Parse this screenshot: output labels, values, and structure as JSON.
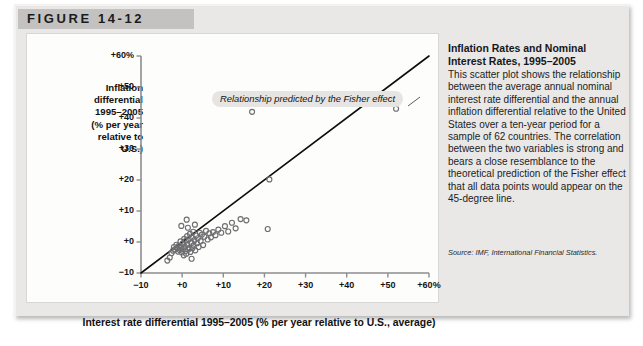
{
  "figure": {
    "label": "FIGURE 14-12"
  },
  "caption": {
    "title": "Inflation Rates and Nominal Interest Rates, 1995–2005",
    "body": "This scatter plot shows the relationship between the average annual nominal interest rate differential and the annual inflation differential relative to the United States over a ten-year period for a sample of 62 countries. The correlation between the two variables is strong and bears a close resemblance to the theoretical prediction of the Fisher effect that all data points would appear on the 45-degree line.",
    "source": "Source: IMF, International Financial Statistics."
  },
  "chart_data": {
    "type": "scatter",
    "title": "Inflation Rates and Nominal Interest Rates, 1995–2005",
    "xlabel": "Interest rate differential 1995–2005 (% per year relative to U.S., average)",
    "ylabel": "Inflation differential 1995–2005 (% per year relative to U.S.)",
    "xlim": [
      -10,
      60
    ],
    "ylim": [
      -10,
      60
    ],
    "xticks": [
      -10,
      0,
      10,
      20,
      30,
      40,
      50,
      60
    ],
    "yticks": [
      -10,
      0,
      10,
      20,
      30,
      40,
      50,
      60
    ],
    "xticklabels": [
      "−10",
      "+0",
      "+10",
      "+20",
      "+30",
      "+40",
      "+50",
      "+60%"
    ],
    "yticklabels": [
      "−10",
      "+0",
      "+10",
      "+20",
      "+30",
      "+40",
      "+50",
      "+60%"
    ],
    "grid": false,
    "legend": null,
    "marker": "open-circle",
    "marker_color": "#6e6e70",
    "annotations": [
      {
        "text": "Relationship predicted by the Fisher effect",
        "x": 12,
        "y": 52,
        "style": "italic-pill"
      }
    ],
    "reference_line": {
      "name": "45-degree line",
      "from": [
        -10,
        -10
      ],
      "to": [
        60,
        60
      ],
      "color": "#0d0d0d",
      "width": 1.6
    },
    "series": [
      {
        "name": "Countries (62)",
        "points": [
          [
            -3.6,
            -6.0
          ],
          [
            -3.0,
            -5.0
          ],
          [
            -2.6,
            -3.6
          ],
          [
            -2.2,
            -2.8
          ],
          [
            -2.0,
            -1.6
          ],
          [
            -1.7,
            -2.4
          ],
          [
            -1.4,
            -0.9
          ],
          [
            -1.2,
            -2.0
          ],
          [
            -1.0,
            -3.1
          ],
          [
            -0.8,
            -1.2
          ],
          [
            -0.6,
            -2.6
          ],
          [
            -0.4,
            0.2
          ],
          [
            -0.3,
            -1.8
          ],
          [
            -0.1,
            -3.4
          ],
          [
            0.1,
            -0.5
          ],
          [
            0.2,
            -2.2
          ],
          [
            0.4,
            -4.3
          ],
          [
            0.5,
            1.0
          ],
          [
            0.6,
            -1.5
          ],
          [
            0.8,
            -2.9
          ],
          [
            0.9,
            0.4
          ],
          [
            1.0,
            -3.8
          ],
          [
            1.2,
            1.9
          ],
          [
            1.3,
            -0.8
          ],
          [
            1.5,
            -2.4
          ],
          [
            1.6,
            0.9
          ],
          [
            1.8,
            -1.9
          ],
          [
            1.9,
            2.6
          ],
          [
            2.0,
            -3.2
          ],
          [
            2.2,
            -0.3
          ],
          [
            2.4,
            1.4
          ],
          [
            2.5,
            -2.0
          ],
          [
            2.7,
            3.3
          ],
          [
            2.8,
            -1.1
          ],
          [
            3.0,
            0.6
          ],
          [
            3.2,
            -2.7
          ],
          [
            3.4,
            2.1
          ],
          [
            3.6,
            -0.4
          ],
          [
            3.8,
            1.2
          ],
          [
            4.0,
            -1.6
          ],
          [
            4.3,
            3.0
          ],
          [
            4.5,
            0.3
          ],
          [
            4.8,
            2.4
          ],
          [
            5.1,
            -1.0
          ],
          [
            5.4,
            1.7
          ],
          [
            5.8,
            3.6
          ],
          [
            6.2,
            0.8
          ],
          [
            6.6,
            2.8
          ],
          [
            7.0,
            1.5
          ],
          [
            7.5,
            3.2
          ],
          [
            8.1,
            2.2
          ],
          [
            8.8,
            4.0
          ],
          [
            9.5,
            3.0
          ],
          [
            10.4,
            5.1
          ],
          [
            11.2,
            3.4
          ],
          [
            12.1,
            6.2
          ],
          [
            13.0,
            4.4
          ],
          [
            14.2,
            7.4
          ],
          [
            15.6,
            7.0
          ],
          [
            17.0,
            42.0
          ],
          [
            20.8,
            4.2
          ],
          [
            21.2,
            20.2
          ],
          [
            52.0,
            43.0
          ],
          [
            -0.2,
            5.2
          ],
          [
            1.1,
            7.2
          ],
          [
            2.3,
            -5.4
          ],
          [
            1.4,
            4.6
          ],
          [
            3.1,
            5.6
          ]
        ]
      }
    ]
  }
}
